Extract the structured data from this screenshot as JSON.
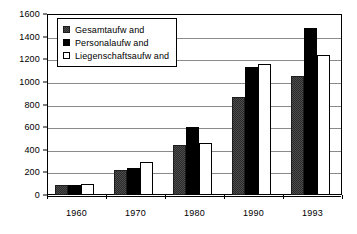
{
  "chart_data": {
    "type": "bar",
    "title": "",
    "subtitle": "",
    "xlabel": "",
    "ylabel": "",
    "categories": [
      "1960",
      "1970",
      "1980",
      "1990",
      "1993"
    ],
    "series": [
      {
        "name": "Gesamtaufw and",
        "color": "#4d4d4d",
        "values": [
          90,
          225,
          440,
          865,
          1055
        ]
      },
      {
        "name": "Personalaufw and",
        "color": "#000000",
        "values": [
          90,
          235,
          605,
          1130,
          1480
        ]
      },
      {
        "name": "Liegenschaftsaufw and",
        "color": "#ffffff",
        "values": [
          95,
          290,
          460,
          1160,
          1240
        ]
      }
    ],
    "ylim": [
      0,
      1600
    ],
    "ytick_step": 200,
    "yticks": [
      "1600",
      "1400",
      "1200",
      "1000",
      "800",
      "600",
      "400",
      "200",
      "0"
    ],
    "ytick_values": [
      1600,
      1400,
      1200,
      1000,
      800,
      600,
      400,
      200,
      0
    ],
    "grid": true,
    "grid_axis": "y",
    "legend": {
      "position": "top-left-inside",
      "entries": [
        "Gesamtaufw and",
        "Personalaufw and",
        "Liegenschaftsaufw and"
      ]
    },
    "frame": true
  }
}
